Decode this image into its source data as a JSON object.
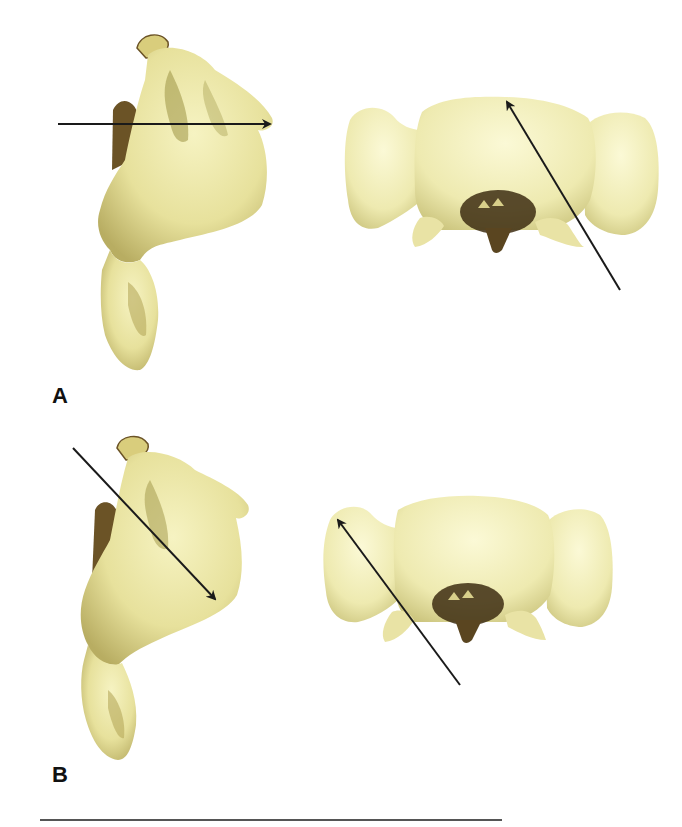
{
  "figure": {
    "panels": [
      {
        "label": "A",
        "views": [
          {
            "name": "lateral-view",
            "arrow": {
              "direction": "horizontal, pointing right (anterior)",
              "from": [
                58,
                124
              ],
              "to": [
                272,
                124
              ]
            }
          },
          {
            "name": "superior-view",
            "arrow": {
              "direction": "oblique, pointing up-left toward midline",
              "from": [
                620,
                290
              ],
              "to": [
                505,
                99
              ]
            }
          }
        ]
      },
      {
        "label": "B",
        "views": [
          {
            "name": "lateral-view",
            "arrow": {
              "direction": "oblique, pointing down-right",
              "from": [
                73,
                448
              ],
              "to": [
                217,
                601
              ]
            }
          },
          {
            "name": "superior-view",
            "arrow": {
              "direction": "oblique, pointing up-left toward transverse process",
              "from": [
                460,
                685
              ],
              "to": [
                336,
                517
              ]
            }
          }
        ]
      }
    ],
    "colors": {
      "bone_light": "#f3f0b6",
      "bone_mid": "#e2dc93",
      "bone_shadow": "#8c7a3c",
      "bone_dark": "#4a3a1c",
      "arrow": "#1a1a1a",
      "rule": "#555555"
    }
  }
}
